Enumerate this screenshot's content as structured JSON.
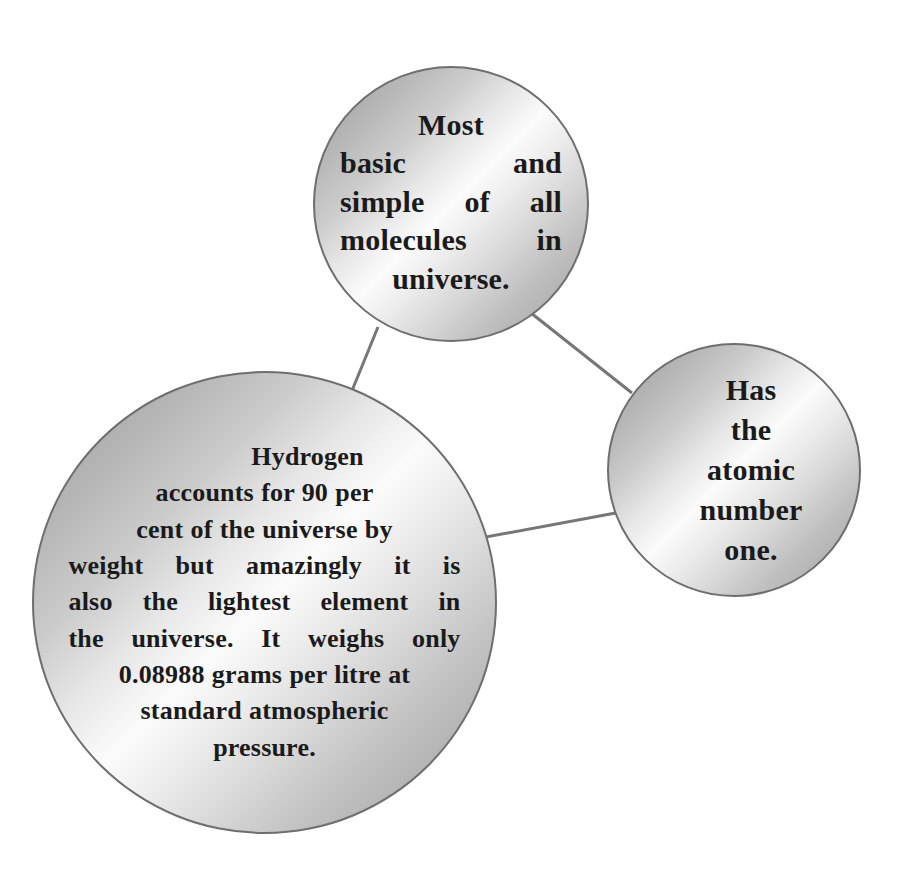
{
  "diagram": {
    "type": "bubble-concept-map",
    "topic": "Hydrogen",
    "background_color": "#ffffff",
    "node_fill_light": "#fbfbfb",
    "node_fill_dark": "#9e9e9e",
    "node_border_color": "#6e6e6e",
    "connector_color": "#767676",
    "text_color": "#1a1a1a",
    "nodes": [
      {
        "id": "top",
        "name": "most-basic-molecule-node",
        "text": "Most basic and simple of all molecules in universe.",
        "lines": [
          "Most",
          "basic and",
          "simple of all",
          "molecules in",
          "universe."
        ]
      },
      {
        "id": "right",
        "name": "atomic-number-node",
        "text": "Has the atomic number one.",
        "lines": [
          "Has",
          "the",
          "atomic",
          "number",
          "one."
        ]
      },
      {
        "id": "main",
        "name": "hydrogen-abundance-node",
        "text": "Hydrogen accounts for 90 per cent of the universe by weight but amazingly it is also the lightest element in the universe. It weighs only 0.08988 grams per litre at standard atmospheric pressure.",
        "lines": [
          "Hydrogen",
          "accounts for 90 per",
          "cent of the universe by",
          "weight but amazingly it is",
          "also the lightest element in",
          "the universe. It weighs only",
          "0.08988 grams per litre at",
          "standard atmospheric",
          "pressure."
        ]
      }
    ],
    "edges": [
      {
        "name": "edge-top-to-main",
        "from": "top",
        "to": "main"
      },
      {
        "name": "edge-top-to-right",
        "from": "top",
        "to": "right"
      },
      {
        "name": "edge-main-to-right",
        "from": "main",
        "to": "right"
      }
    ]
  }
}
